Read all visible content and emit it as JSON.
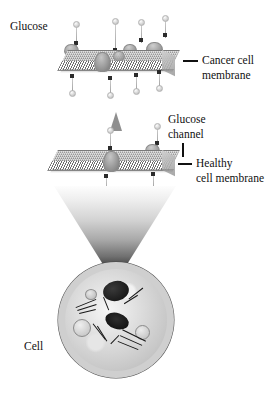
{
  "figure": {
    "background_color": "#ffffff",
    "labels": {
      "glucose": "Glucose",
      "cancer_membrane": "Cancer cell\nmembrane",
      "cancer_membrane_line1": "Cancer cell",
      "cancer_membrane_line2": "membrane",
      "glucose_channel_line1": "Glucose",
      "glucose_channel_line2": "channel",
      "healthy_membrane_line1": "Healthy",
      "healthy_membrane_line2": "cell membrane",
      "cell": "Cell"
    },
    "colors": {
      "membrane_head": "#8f8f8f",
      "membrane_tail": "#6f6f6f",
      "channel": "#9c9c9c",
      "glucose_marker": "#2b2b2b",
      "arrow": "#8f8f8f",
      "cell_rim": "#111111",
      "text": "#111111"
    },
    "cancer_membrane": {
      "channel_count": 5,
      "description": "Membrane slab drawn in perspective with many glucose channels"
    },
    "healthy_membrane": {
      "channel_count": 2,
      "description": "Membrane slab drawn in perspective with few glucose channels"
    },
    "glucose_markers_top": 4,
    "glucose_markers_between": 4,
    "glucose_markers_bottom": 2,
    "cone": {
      "description": "Magnification cone linking healthy membrane to cell",
      "gradient_from": "#fdfdfd",
      "gradient_to": "#3a3a3a"
    },
    "cell": {
      "description": "Grayscale electron-micrograph style cell with ragged dark membrane and internal organelles"
    }
  }
}
